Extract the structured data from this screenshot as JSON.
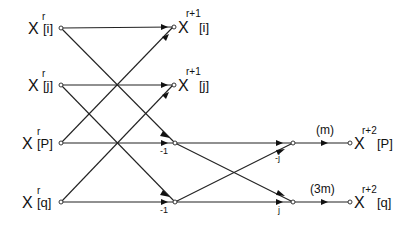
{
  "diagram": {
    "type": "signal-flow-graph",
    "inputs": [
      {
        "base": "X",
        "sup": "r",
        "idx": "[i]"
      },
      {
        "base": "X",
        "sup": "r",
        "idx": "[j]"
      },
      {
        "base": "X",
        "sup": "r",
        "idx": "[P]"
      },
      {
        "base": "X",
        "sup": "r",
        "idx": "[q]"
      }
    ],
    "stage1_outputs": [
      {
        "base": "X",
        "sup": "r+1",
        "idx": "[i]"
      },
      {
        "base": "X",
        "sup": "r+1",
        "idx": "[j]"
      }
    ],
    "stage2_outputs": [
      {
        "base": "X",
        "sup": "r+2",
        "idx": "[P]",
        "twiddle": "(m)"
      },
      {
        "base": "X",
        "sup": "r+2",
        "idx": "[q]",
        "twiddle": "(3m)"
      }
    ],
    "branch_weights": {
      "p_row_stage1": "-1",
      "q_row_stage1": "-1",
      "p_row_stage2_cross": "-j",
      "q_row_stage2": "j"
    }
  }
}
